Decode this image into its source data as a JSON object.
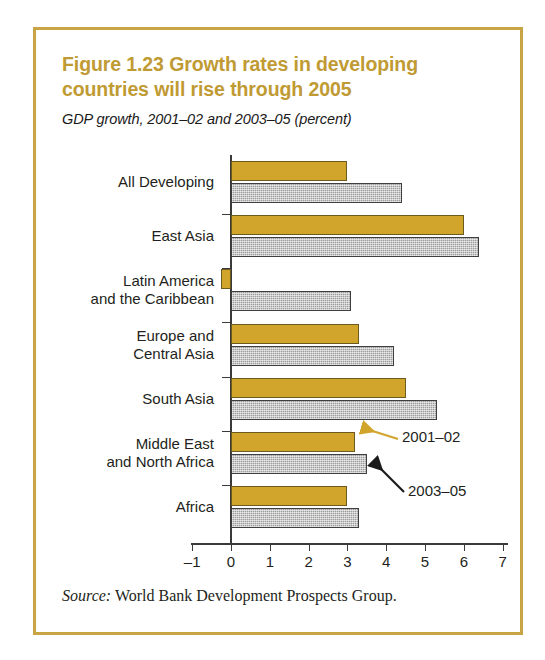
{
  "figure": {
    "title": "Figure 1.23  Growth rates in developing countries will rise through 2005",
    "subtitle": "GDP growth, 2001–02 and 2003–05 (percent)",
    "source_word": "Source:",
    "source_text": " World Bank Development Prospects Group.",
    "border_color": "#c9a444",
    "title_color": "#c09a33"
  },
  "annotations": {
    "first": {
      "label": "2001–02",
      "arrow_color": "#d1a42b"
    },
    "second": {
      "label": "2003–05",
      "arrow_color": "#1a1a1a"
    }
  },
  "chart_data": {
    "type": "bar",
    "orientation": "horizontal",
    "title": "Figure 1.23  Growth rates in developing countries will rise through 2005",
    "subtitle": "GDP growth, 2001–02 and 2003–05 (percent)",
    "xlabel": "",
    "ylabel": "",
    "xlim": [
      -1,
      7
    ],
    "xticks": [
      -1,
      0,
      1,
      2,
      3,
      4,
      5,
      6,
      7
    ],
    "xtick_labels": [
      "–1",
      "0",
      "1",
      "2",
      "3",
      "4",
      "5",
      "6",
      "7"
    ],
    "grid": false,
    "legend": "annotated-arrows",
    "categories": [
      "All Developing",
      "East Asia",
      "Latin America\nand the Caribbean",
      "Europe and\nCentral Asia",
      "South Asia",
      "Middle East\nand North Africa",
      "Africa"
    ],
    "series": [
      {
        "name": "2001–02",
        "color": "#d1a42b",
        "values": [
          3.0,
          6.0,
          -0.25,
          3.3,
          4.5,
          3.2,
          3.0
        ]
      },
      {
        "name": "2003–05",
        "color": "#9d9d9d",
        "values": [
          4.4,
          6.4,
          3.1,
          4.2,
          5.3,
          3.5,
          3.3
        ]
      }
    ],
    "source": "Source: World Bank Development Prospects Group."
  }
}
